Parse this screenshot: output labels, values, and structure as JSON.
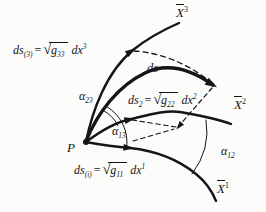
{
  "figure": {
    "colors": {
      "ink": "#151515",
      "background": "#fcfcfb"
    }
  },
  "point_label": "P",
  "curve_label": {
    "text": "ds"
  },
  "axes": {
    "x1": {
      "base": "X",
      "sup": "1"
    },
    "x2": {
      "base": "X",
      "sup": "2"
    },
    "x3": {
      "base": "X",
      "sup": "3"
    }
  },
  "angles": {
    "a23": {
      "base": "α",
      "sub": "23"
    },
    "a13": {
      "base": "α",
      "sub": "13"
    },
    "a12": {
      "base": "α",
      "sub": "12"
    }
  },
  "equations": {
    "e3": {
      "lhs": "ds",
      "lhs_sub": "(3)",
      "equals": "=",
      "radical": "√",
      "radicand": "g",
      "radicand_sub": "33",
      "differential": "dx",
      "differential_sup": "3"
    },
    "e2": {
      "lhs": "ds",
      "lhs_sub": "2",
      "equals": "=",
      "radical": "√",
      "radicand": "g",
      "radicand_sub": "22",
      "differential": "dx",
      "differential_sup": "2"
    },
    "e1": {
      "lhs": "ds",
      "lhs_sub": "(i)",
      "equals": "=",
      "radical": "√",
      "radicand": "g",
      "radicand_sub": "11",
      "differential": "dx",
      "differential_sup": "1"
    }
  }
}
